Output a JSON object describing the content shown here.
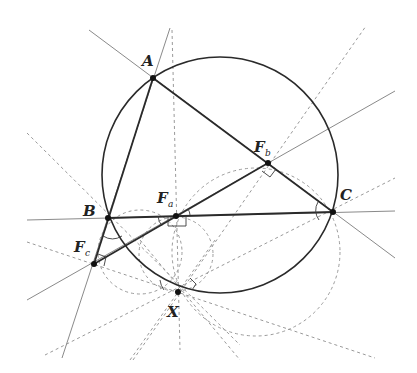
{
  "diagram": {
    "points": {
      "A": {
        "label": "A",
        "x": 153,
        "y": 78
      },
      "B": {
        "label": "B",
        "x": 108,
        "y": 218
      },
      "C": {
        "label": "C",
        "x": 333,
        "y": 212
      },
      "Fa": {
        "label": "F",
        "sub": "a",
        "x": 176,
        "y": 216
      },
      "Fb": {
        "label": "F",
        "sub": "b",
        "x": 268,
        "y": 163
      },
      "Fc": {
        "label": "F",
        "sub": "c",
        "x": 94,
        "y": 264
      },
      "X": {
        "label": "X",
        "x": 178,
        "y": 292
      }
    },
    "circumcircle": {
      "cx": 220,
      "cy": 175,
      "r": 118
    },
    "colors": {
      "solid": "#2a2a2a",
      "construction": "#9a9a9a",
      "thin_line": "#8a8a8a"
    }
  }
}
